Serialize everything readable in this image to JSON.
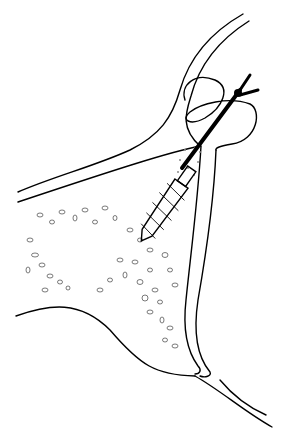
{
  "figure": {
    "type": "medical-line-illustration",
    "colors": {
      "stroke": "#000000",
      "background": "#ffffff",
      "stipple": "#888888"
    },
    "elements": [
      {
        "name": "bone-outer-outline",
        "description": "curved outer cortical outline"
      },
      {
        "name": "sinus-membrane-loop",
        "description": "looped membrane near upper right"
      },
      {
        "name": "cancellous-bone-texture",
        "description": "scattered oval cell pattern"
      },
      {
        "name": "threaded-implant",
        "description": "screw-type implant inserted diagonally"
      },
      {
        "name": "instrument-shaft",
        "description": "thick black instrument rod with forked tip"
      },
      {
        "name": "graft-stipple",
        "description": "stippled graft material around implant top"
      }
    ]
  }
}
